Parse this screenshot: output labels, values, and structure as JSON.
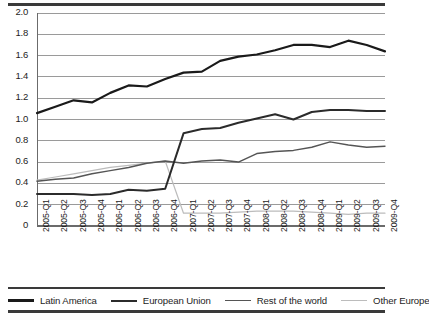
{
  "chart_data": {
    "type": "line",
    "title": "",
    "xlabel": "",
    "ylabel": "",
    "ylim": [
      0,
      2.0
    ],
    "yticks": [
      "0",
      "0.2",
      "0.4",
      "0.6",
      "0.8",
      "1.0",
      "1.2",
      "1.4",
      "1.6",
      "1.8",
      "2.0"
    ],
    "ytick_values": [
      0,
      0.2,
      0.4,
      0.6,
      0.8,
      1.0,
      1.2,
      1.4,
      1.6,
      1.8,
      2.0
    ],
    "grid": true,
    "grid_axis": "y",
    "legend_position": "bottom",
    "categories": [
      "2005-Q1",
      "2005-Q2",
      "2005-Q3",
      "2005-Q4",
      "2006-Q1",
      "2006-Q2",
      "2006-Q3",
      "2006-Q4",
      "2007-Q1",
      "2007-Q2",
      "2007-Q3",
      "2007-Q4",
      "2008-Q1",
      "2008-Q2",
      "2008-Q3",
      "2008-Q4",
      "2009-Q1",
      "2009-Q2",
      "2009-Q3",
      "2009-Q4"
    ],
    "series": [
      {
        "name": "Latin America",
        "color": "#1a1a1a",
        "width": 2.2,
        "values": [
          1.06,
          1.12,
          1.18,
          1.16,
          1.25,
          1.32,
          1.31,
          1.38,
          1.44,
          1.45,
          1.55,
          1.59,
          1.61,
          1.65,
          1.7,
          1.7,
          1.68,
          1.74,
          1.7,
          1.64
        ]
      },
      {
        "name": "European Union",
        "color": "#2b2b2b",
        "width": 2.0,
        "values": [
          0.3,
          0.3,
          0.3,
          0.29,
          0.3,
          0.34,
          0.33,
          0.35,
          0.87,
          0.91,
          0.92,
          0.97,
          1.01,
          1.05,
          1.0,
          1.07,
          1.09,
          1.09,
          1.08,
          1.08
        ]
      },
      {
        "name": "Rest of the world",
        "color": "#555555",
        "width": 1.5,
        "values": [
          0.42,
          0.44,
          0.45,
          0.49,
          0.52,
          0.55,
          0.59,
          0.61,
          0.59,
          0.61,
          0.62,
          0.6,
          0.68,
          0.7,
          0.71,
          0.74,
          0.79,
          0.76,
          0.74,
          0.75
        ]
      },
      {
        "name": "Other Europe",
        "color": "#bcbcbc",
        "width": 1.2,
        "values": [
          0.43,
          0.46,
          0.49,
          0.52,
          0.55,
          0.57,
          0.59,
          0.61,
          0.12,
          0.12,
          0.12,
          0.13,
          0.14,
          0.14,
          0.14,
          0.13,
          0.12,
          0.11,
          0.12,
          0.12
        ]
      }
    ]
  },
  "legend": {
    "items": [
      {
        "label": "Latin America"
      },
      {
        "label": "European Union"
      },
      {
        "label": "Rest of the world"
      },
      {
        "label": "Other Europe"
      }
    ]
  }
}
